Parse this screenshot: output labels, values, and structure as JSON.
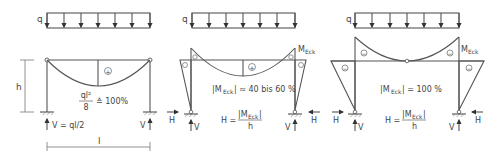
{
  "diagram": {
    "type": "structural frame moment diagrams",
    "load_label": "q",
    "frames": [
      {
        "id": "simple-beam",
        "span_label": "l",
        "height_label": "h",
        "moment_sign": "+",
        "moment_formula_num": "ql²",
        "moment_formula_den": "8",
        "moment_ratio": "≙ 100%",
        "reaction_left": "V = ql/2",
        "reaction_right": "V"
      },
      {
        "id": "partial-fixed-frame",
        "corner_label_main": "M",
        "corner_label_sub": "Eck",
        "moment_sign_field": "+",
        "moment_sign_corner": "−",
        "statement_pre": "|M",
        "statement_sub": "Eck",
        "statement_post": "| ≈ 40 bis 60 %",
        "h_formula_lhs": "H =",
        "h_formula_num_pre": "|M",
        "h_formula_num_sub": "Eck",
        "h_formula_num_post": "|",
        "h_formula_den": "h",
        "reaction_h": "H",
        "reaction_v": "V"
      },
      {
        "id": "full-fixed-frame",
        "corner_label_main": "M",
        "corner_label_sub": "Eck",
        "moment_sign_corner": "−",
        "statement_pre": "|M",
        "statement_sub": "Eck",
        "statement_post": "| = 100 %",
        "h_formula_lhs": "H =",
        "h_formula_num_pre": "|M",
        "h_formula_num_sub": "Eck",
        "h_formula_num_post": "|",
        "h_formula_den": "h",
        "reaction_h": "H",
        "reaction_v": "V"
      }
    ]
  }
}
